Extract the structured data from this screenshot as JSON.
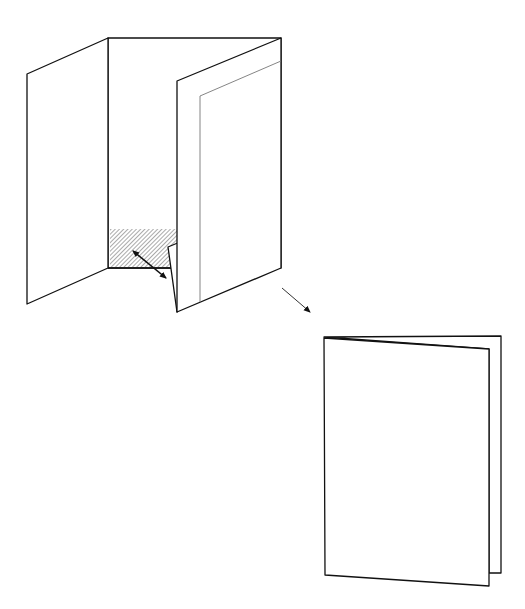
{
  "diagram": {
    "colors": {
      "background": "#ffffff",
      "stroke": "#111111",
      "inner_line": "#777777",
      "hatch": "#555555"
    },
    "step1": {
      "label": "open-folded-sheet",
      "parts": [
        "left-panel",
        "back-panel",
        "right-panel",
        "inner-panel",
        "hatched-pocket",
        "tuck-flap",
        "double-arrow"
      ]
    },
    "transition_arrow": "arrow-down-right",
    "step2": {
      "label": "closed-booklet",
      "parts": [
        "back-page",
        "front-page"
      ]
    }
  }
}
